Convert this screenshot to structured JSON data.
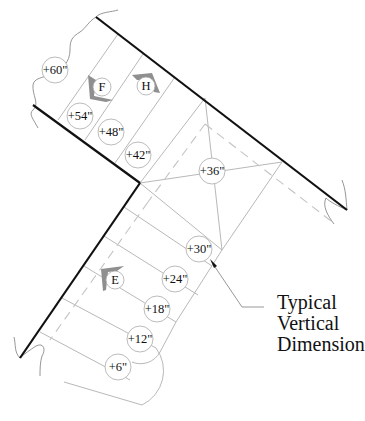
{
  "diagram": {
    "type": "stair-plan-elevation-markers",
    "elevations": [
      {
        "id": "e60",
        "label": "+60\"",
        "x": 55,
        "y": 70
      },
      {
        "id": "e54",
        "label": "+54\"",
        "x": 80,
        "y": 116
      },
      {
        "id": "e48",
        "label": "+48\"",
        "x": 111,
        "y": 132
      },
      {
        "id": "e42",
        "label": "+42\"",
        "x": 138,
        "y": 155
      },
      {
        "id": "e36",
        "label": "+36\"",
        "x": 212,
        "y": 171
      },
      {
        "id": "e30",
        "label": "+30\"",
        "x": 199,
        "y": 249
      },
      {
        "id": "e24",
        "label": "+24\"",
        "x": 175,
        "y": 279
      },
      {
        "id": "e18",
        "label": "+18\"",
        "x": 157,
        "y": 309
      },
      {
        "id": "e12",
        "label": "+12\"",
        "x": 140,
        "y": 339
      },
      {
        "id": "e6",
        "label": "+6\"",
        "x": 118,
        "y": 367
      }
    ],
    "markers": [
      {
        "id": "F",
        "label": "F",
        "x": 102,
        "y": 87
      },
      {
        "id": "H",
        "label": "H",
        "x": 146,
        "y": 86
      },
      {
        "id": "E",
        "label": "E",
        "x": 115,
        "y": 280
      }
    ],
    "callout": {
      "lines": [
        "Typical",
        "Vertical",
        "Dimension"
      ]
    },
    "colors": {
      "thick_edge": "#111111",
      "thin_line": "#b0b0b0",
      "dashed_line": "#c4c4c4",
      "arrow_fill": "#8f8f8f"
    }
  }
}
